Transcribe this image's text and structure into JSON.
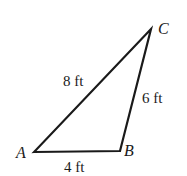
{
  "diagram": {
    "type": "triangle",
    "vertices": [
      {
        "name": "A",
        "x": 34,
        "y": 152
      },
      {
        "name": "B",
        "x": 120,
        "y": 151
      },
      {
        "name": "C",
        "x": 151,
        "y": 29
      }
    ],
    "sides": [
      {
        "from": "A",
        "to": "B",
        "label": "4 ft"
      },
      {
        "from": "B",
        "to": "C",
        "label": "6 ft"
      },
      {
        "from": "A",
        "to": "C",
        "label": "8 ft"
      }
    ],
    "labels": {
      "A": "A",
      "B": "B",
      "C": "C",
      "AB": "4 ft",
      "BC": "6 ft",
      "AC": "8 ft"
    },
    "colors": {
      "stroke": "#1a1a1a",
      "background": "#ffffff"
    }
  }
}
